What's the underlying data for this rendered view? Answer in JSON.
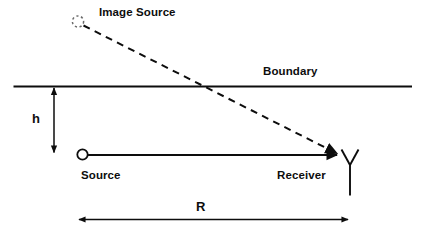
{
  "figure": {
    "type": "ray-geometry-diagram",
    "background_color": "#ffffff",
    "stroke_color": "#0d0d0d",
    "labels": {
      "image_source": "Image Source",
      "boundary": "Boundary",
      "height": "h",
      "source": "Source",
      "receiver": "Receiver",
      "range": "R"
    },
    "elements": {
      "image_source_marker": "dashed-circle-icon",
      "source_marker": "open-circle-icon",
      "receiver_marker": "antenna-y-icon",
      "reflected_ray": "dashed-arrow-line",
      "direct_ray": "solid-arrow-line",
      "height_dimension": "double-headed-vertical-arrow",
      "range_dimension": "double-headed-horizontal-arrow",
      "boundary_interface": "solid-horizontal-line"
    }
  }
}
